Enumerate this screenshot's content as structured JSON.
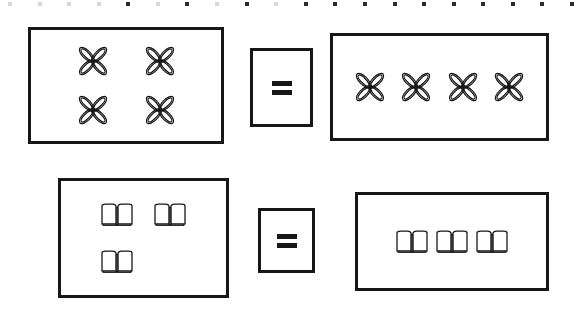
{
  "page": {
    "type": "math-worksheet",
    "background_color": "#ffffff",
    "ink_color": "#17171a",
    "width": 578,
    "height": 316
  },
  "perforation": {
    "name": "top-edge-perforation",
    "mark_count": 20,
    "color": "#2b2b2f"
  },
  "rows": [
    {
      "id": "row-1",
      "icon": "flower-icon",
      "icon_label": "four-petal flower",
      "left_group": {
        "label": "2 rows of 2 flowers",
        "count": 4,
        "arrangement": "2x2",
        "rect": {
          "x": 28,
          "y": 27,
          "w": 196,
          "h": 117
        }
      },
      "operator": {
        "label": "=",
        "name": "equals-sign",
        "rect": {
          "x": 250,
          "y": 48,
          "w": 63,
          "h": 79
        }
      },
      "right_group": {
        "label": "4 flowers in a row",
        "count": 4,
        "arrangement": "1x4",
        "rect": {
          "x": 330,
          "y": 33,
          "w": 219,
          "h": 108
        }
      }
    },
    {
      "id": "row-2",
      "icon": "book-icon",
      "icon_label": "open book",
      "left_group": {
        "label": "3 books, 2 on top row and 1 below",
        "count": 3,
        "arrangement": "2+1",
        "rect": {
          "x": 58,
          "y": 178,
          "w": 171,
          "h": 120
        }
      },
      "operator": {
        "label": "=",
        "name": "equals-sign",
        "rect": {
          "x": 258,
          "y": 208,
          "w": 57,
          "h": 65
        }
      },
      "right_group": {
        "label": "3 books in a row",
        "count": 3,
        "arrangement": "1x3",
        "rect": {
          "x": 355,
          "y": 192,
          "w": 194,
          "h": 99
        }
      }
    }
  ]
}
